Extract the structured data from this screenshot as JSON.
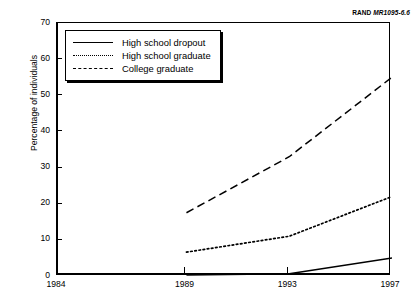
{
  "source_note": {
    "prefix": "RAND ",
    "code": "MR1095-6.6"
  },
  "legend": {
    "items": [
      {
        "label": "High school dropout",
        "style": "solid",
        "swatch_name": "solid-line-swatch"
      },
      {
        "label": "High school graduate",
        "style": "dotted",
        "swatch_name": "dotted-line-swatch"
      },
      {
        "label": "College graduate",
        "style": "dashed",
        "swatch_name": "dashed-line-swatch"
      }
    ]
  },
  "chart_data": {
    "type": "line",
    "title": "",
    "xlabel": "",
    "ylabel": "Percentage of individuals",
    "x": [
      1984,
      1989,
      1993,
      1997
    ],
    "xlim": [
      1984,
      1997
    ],
    "ylim": [
      0,
      70
    ],
    "xticks": [
      "1984",
      "1989",
      "1993",
      "1997"
    ],
    "yticks": [
      "0",
      "10",
      "20",
      "30",
      "40",
      "50",
      "60",
      "70"
    ],
    "grid": false,
    "legend_position": "upper-left-inside",
    "series": [
      {
        "name": "High school dropout",
        "style": "solid",
        "x": [
          1989,
          1993,
          1997
        ],
        "values": [
          0.3,
          0.6,
          5.0
        ]
      },
      {
        "name": "High school graduate",
        "style": "dotted",
        "x": [
          1989,
          1993,
          1997
        ],
        "values": [
          6.6,
          11.0,
          22.0
        ]
      },
      {
        "name": "College graduate",
        "style": "dashed",
        "x": [
          1989,
          1993,
          1997
        ],
        "values": [
          17.5,
          33.0,
          55.0
        ]
      }
    ]
  },
  "colors": {
    "ink": "#000000",
    "background": "#ffffff"
  }
}
